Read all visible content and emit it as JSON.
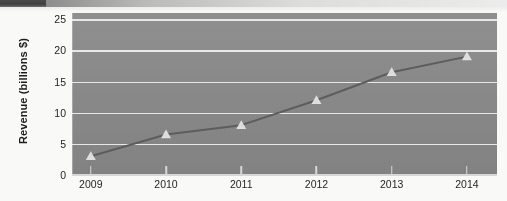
{
  "chart_data": {
    "type": "line",
    "title": "",
    "subtitle": "",
    "xlabel": "",
    "ylabel": "Revenue (billions $)",
    "categories": [
      "2009",
      "2010",
      "2011",
      "2012",
      "2013",
      "2014"
    ],
    "x": [
      2009,
      2010,
      2011,
      2012,
      2013,
      2014
    ],
    "values": [
      3,
      6.5,
      8,
      12,
      16.5,
      19
    ],
    "series": [
      {
        "name": "Revenue",
        "values": [
          3,
          6.5,
          8,
          12,
          16.5,
          19
        ]
      }
    ],
    "ylim": [
      0,
      26
    ],
    "xlim": [
      2008.75,
      2014.4
    ],
    "yticks": [
      0,
      5,
      10,
      15,
      20,
      25
    ],
    "ytick_labels": [
      "0",
      "5",
      "10",
      "15",
      "20",
      "25"
    ],
    "xtick_labels": [
      "2009",
      "2010",
      "2011",
      "2012",
      "2013",
      "2014"
    ],
    "grid": "horizontal",
    "legend": "none",
    "marker": "triangle",
    "colors": {
      "plot_background": "#8b8b8b",
      "gridline": "#f2f2f2",
      "line": "#5e5e5e",
      "marker": "#e8e8e8",
      "text": "#1f1f1f"
    }
  },
  "axis": {
    "y_title": "Revenue (billions $)",
    "y_ticks": [
      {
        "label": "25",
        "value": 25
      },
      {
        "label": "20",
        "value": 20
      },
      {
        "label": "15",
        "value": 15
      },
      {
        "label": "10",
        "value": 10
      },
      {
        "label": "5",
        "value": 5
      },
      {
        "label": "0",
        "value": 0
      }
    ],
    "x_ticks": [
      {
        "label": "2009",
        "value": 2009
      },
      {
        "label": "2010",
        "value": 2010
      },
      {
        "label": "2011",
        "value": 2011
      },
      {
        "label": "2012",
        "value": 2012
      },
      {
        "label": "2013",
        "value": 2013
      },
      {
        "label": "2014",
        "value": 2014
      }
    ]
  }
}
